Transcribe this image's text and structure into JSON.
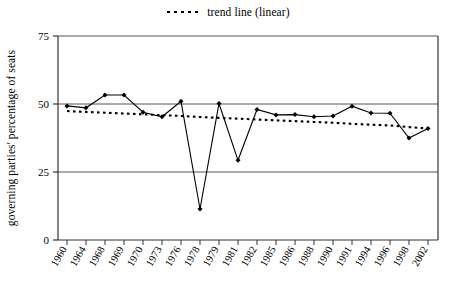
{
  "chart_data": {
    "type": "line",
    "title": "",
    "subtitle": "",
    "xlabel": "",
    "ylabel": "governing parties' percentage of seats",
    "categories": [
      "1960",
      "1964",
      "1968",
      "1969",
      "1970",
      "1973",
      "1976",
      "1978",
      "1979",
      "1981",
      "1982",
      "1985",
      "1986",
      "1988",
      "1990",
      "1991",
      "1994",
      "1996",
      "1998",
      "2002"
    ],
    "ylim": [
      0,
      75
    ],
    "yticks": [
      0,
      25,
      50,
      75
    ],
    "ytick_labels": [
      "0",
      "25",
      "50",
      "75"
    ],
    "grid": "horizontal gridlines at 25, 50, 75",
    "legend_position": "top-center",
    "series": [
      {
        "name": "governing parties' percentage of seats",
        "style": "solid line with filled diamond markers",
        "color": "#000000",
        "values": [
          49.3,
          48.6,
          53.3,
          53.3,
          47.0,
          45.3,
          51.0,
          11.4,
          50.2,
          29.3,
          48.0,
          46.0,
          46.1,
          45.3,
          45.6,
          49.2,
          46.7,
          46.6,
          37.5,
          41.0
        ]
      },
      {
        "name": "trend line (linear)",
        "style": "dotted line",
        "color": "#000000",
        "values": [
          47.4,
          47.1,
          46.8,
          46.5,
          46.2,
          45.9,
          45.6,
          45.2,
          44.9,
          44.6,
          44.3,
          44.0,
          43.7,
          43.4,
          43.1,
          42.7,
          42.4,
          42.1,
          41.5,
          41.0
        ]
      }
    ]
  },
  "legend": {
    "entries": [
      {
        "label": "trend line (linear)",
        "marker": "dotted-line-swatch"
      }
    ]
  }
}
